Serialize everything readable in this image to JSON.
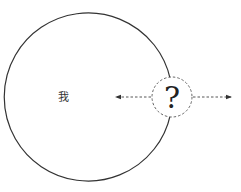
{
  "diagram": {
    "big_circle": {
      "label": "我",
      "cx": 99,
      "cy": 97,
      "r": 84,
      "stroke": "#333333"
    },
    "unknown_circle": {
      "label": "?",
      "cx": 172,
      "cy": 97,
      "r": 20,
      "stroke": "#555555",
      "dashed": true
    },
    "arrows": [
      {
        "name": "arrow-left",
        "from": [
          152,
          97
        ],
        "to": [
          115,
          97
        ],
        "dashed": true
      },
      {
        "name": "arrow-right",
        "from": [
          192,
          97
        ],
        "to": [
          232,
          97
        ],
        "dashed": true
      }
    ]
  }
}
